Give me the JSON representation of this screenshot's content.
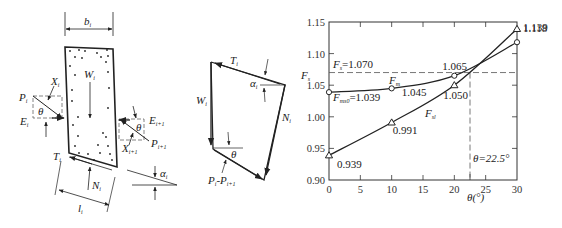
{
  "figure_a": {
    "width_label": "b",
    "width_sub": "i",
    "weight_label": "W",
    "weight_sub": "i",
    "left_force": {
      "P": "P",
      "P_sub": "i",
      "X": "X",
      "X_sub": "i",
      "E": "E",
      "E_sub": "i",
      "angle": "θ"
    },
    "right_force": {
      "P": "P",
      "P_sub": "i+1",
      "X": "X",
      "X_sub": "i+1",
      "E": "E",
      "E_sub": "i+1",
      "angle": "θ"
    },
    "base_shear": "T",
    "base_shear_sub": "i",
    "normal": "N",
    "normal_sub": "i",
    "length": "l",
    "length_sub": "i",
    "slope_angle": "α",
    "slope_angle_sub": "i"
  },
  "figure_b": {
    "T": "T",
    "T_sub": "i",
    "W": "W",
    "W_sub": "i",
    "N": "N",
    "N_sub": "i",
    "alpha": "α",
    "alpha_sub": "i",
    "theta": "θ",
    "P_diff": "P",
    "P_diff_sub1": "i",
    "P_diff_mid": "-P",
    "P_diff_sub2": "i+1"
  },
  "chart_data": {
    "type": "line",
    "title": "",
    "xlabel": "θ(°)",
    "ylabel": "F",
    "ylabel_sub": "s",
    "xlim": [
      0,
      30
    ],
    "ylim": [
      0.9,
      1.15
    ],
    "x_ticks": [
      "0",
      "5",
      "10",
      "15",
      "20",
      "25",
      "30"
    ],
    "y_ticks": [
      "0.90",
      "0.95",
      "1.00",
      "1.05",
      "1.10",
      "1.15"
    ],
    "grid": false,
    "series": [
      {
        "name": "F_m",
        "label": "F",
        "label_sub": "m",
        "marker": "circle",
        "x": [
          0,
          10,
          20,
          30
        ],
        "y": [
          1.039,
          1.045,
          1.065,
          1.118
        ],
        "point_labels": [
          "1.039",
          "1.045",
          "1.065",
          "1.118"
        ]
      },
      {
        "name": "F_sl",
        "label": "F",
        "label_sub": "sl",
        "marker": "triangle",
        "x": [
          0,
          10,
          20,
          30
        ],
        "y": [
          0.939,
          0.991,
          1.05,
          1.139
        ],
        "point_labels": [
          "0.939",
          "0.991",
          "1.050",
          "1.139"
        ]
      }
    ],
    "annotations": [
      {
        "text": "F",
        "sub": "s",
        "suffix": "=1.070",
        "type": "hline",
        "y": 1.07
      },
      {
        "text": "F",
        "sub": "ms0",
        "suffix": "=1.039",
        "type": "label",
        "x": 0,
        "y": 1.039
      },
      {
        "text": "θ=22.5°",
        "type": "vline",
        "x": 22.5
      }
    ]
  }
}
